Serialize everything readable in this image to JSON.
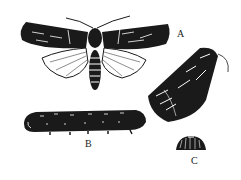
{
  "figure": {
    "labels": {
      "a": "A",
      "b": "B",
      "c": "C"
    },
    "parts": [
      {
        "id": "A",
        "description": "adult moth, wings spread and at rest"
      },
      {
        "id": "B",
        "description": "larva (caterpillar)"
      },
      {
        "id": "C",
        "description": "egg"
      }
    ],
    "colors": {
      "ink": "#1a1a1a",
      "paper": "#ffffff"
    }
  }
}
